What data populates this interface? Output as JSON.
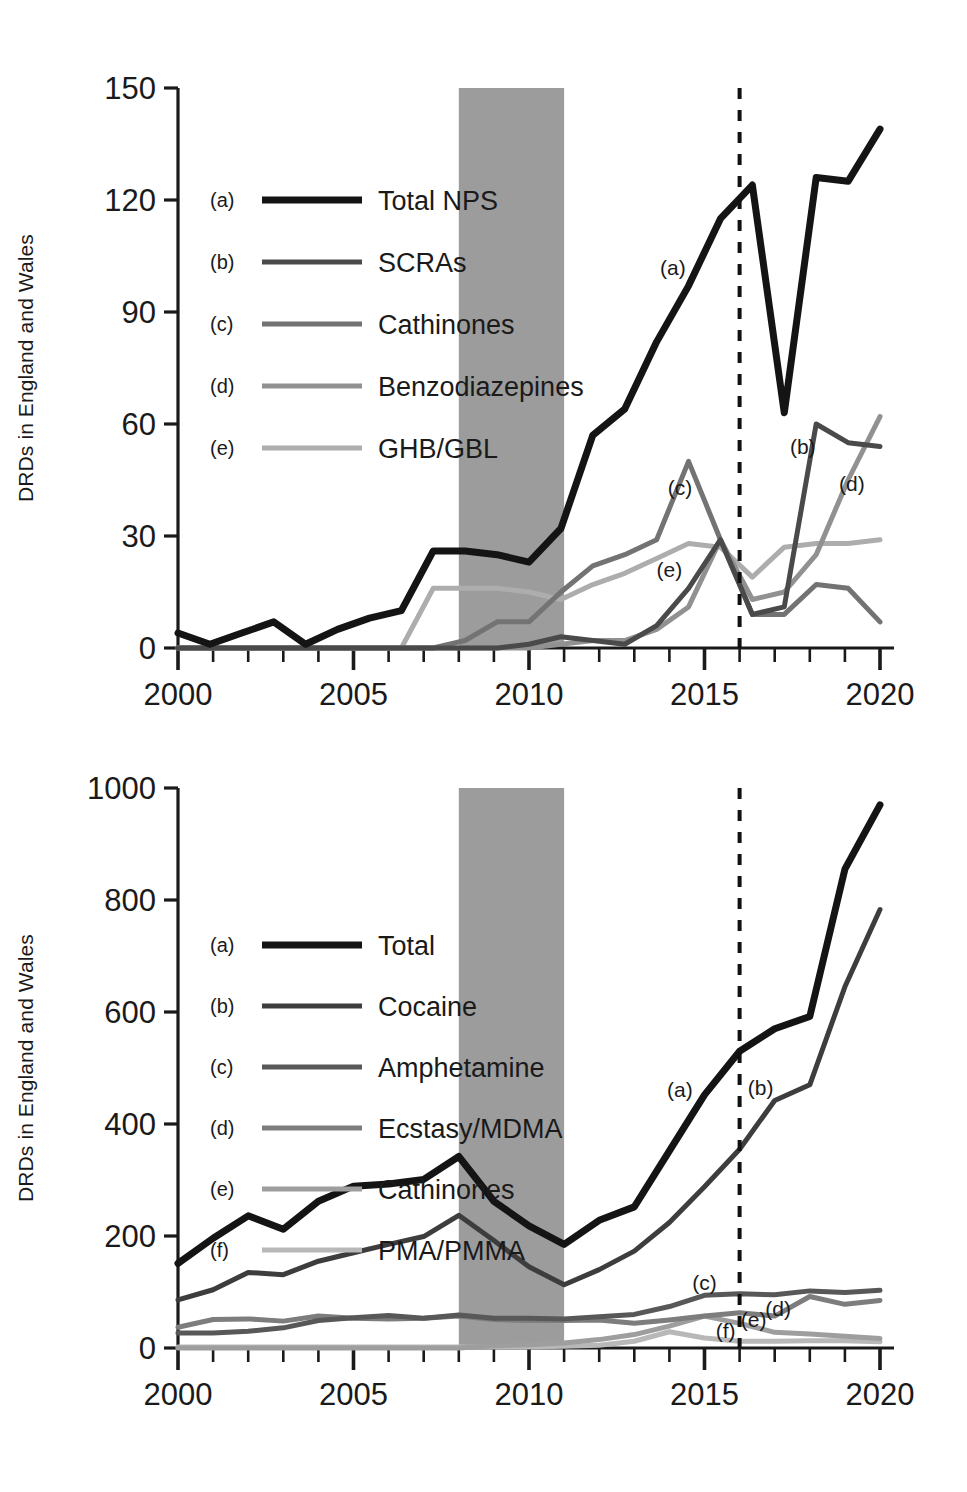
{
  "figure": {
    "panels": [
      {
        "id": "top",
        "ylabel": "DRDs in England and Wales",
        "axis": {
          "yticks": [
            0,
            30,
            60,
            90,
            120,
            150
          ],
          "ylim": [
            0,
            150
          ],
          "xticks": [
            2000,
            2005,
            2010,
            2015,
            2020
          ],
          "xtick_labels": [
            "2000",
            "2005",
            "2010",
            "2015",
            "2020"
          ],
          "xlim": [
            2000,
            2020
          ],
          "xminor_step": 1
        },
        "shaded_band": {
          "start": 2008,
          "end": 2011,
          "color": "#9c9c9c"
        },
        "dashed_line": {
          "x": 2016,
          "color": "#111111"
        },
        "legend": [
          {
            "key": "(a)",
            "label": "Total NPS",
            "color": "#141414",
            "width": 7
          },
          {
            "key": "(b)",
            "label": "SCRAs",
            "color": "#4a4a4a",
            "width": 5
          },
          {
            "key": "(c)",
            "label": "Cathinones",
            "color": "#737373",
            "width": 5
          },
          {
            "key": "(d)",
            "label": "Benzodiazepines",
            "color": "#919191",
            "width": 5
          },
          {
            "key": "(e)",
            "label": "GHB/GBL",
            "color": "#adadad",
            "width": 5
          }
        ],
        "annotations": [
          {
            "text": "(a)",
            "x": 2014.1,
            "y": 100
          },
          {
            "text": "(b)",
            "x": 2017.8,
            "y": 52
          },
          {
            "text": "(c)",
            "x": 2014.3,
            "y": 41
          },
          {
            "text": "(d)",
            "x": 2019.2,
            "y": 42
          },
          {
            "text": "(e)",
            "x": 2014.0,
            "y": 19
          }
        ]
      },
      {
        "id": "bottom",
        "ylabel": "DRDs in England and Wales",
        "axis": {
          "yticks": [
            0,
            200,
            400,
            600,
            800,
            1000
          ],
          "ylim": [
            0,
            1000
          ],
          "xticks": [
            2000,
            2005,
            2010,
            2015,
            2020
          ],
          "xtick_labels": [
            "2000",
            "2005",
            "2010",
            "2015",
            "2020"
          ],
          "xlim": [
            2000,
            2020
          ],
          "xminor_step": 1
        },
        "shaded_band": {
          "start": 2008,
          "end": 2011,
          "color": "#9c9c9c"
        },
        "dashed_line": {
          "x": 2016,
          "color": "#111111"
        },
        "legend": [
          {
            "key": "(a)",
            "label": "Total",
            "color": "#141414",
            "width": 7
          },
          {
            "key": "(b)",
            "label": "Cocaine",
            "color": "#3d3d3d",
            "width": 5
          },
          {
            "key": "(c)",
            "label": "Amphetamine",
            "color": "#585858",
            "width": 5
          },
          {
            "key": "(d)",
            "label": "Ecstasy/MDMA",
            "color": "#7d7d7d",
            "width": 5
          },
          {
            "key": "(e)",
            "label": "Cathinones",
            "color": "#9e9e9e",
            "width": 5
          },
          {
            "key": "(f)",
            "label": "PMA/PMMA",
            "color": "#b8b8b8",
            "width": 5
          }
        ],
        "annotations": [
          {
            "text": "(a)",
            "x": 2014.3,
            "y": 448
          },
          {
            "text": "(b)",
            "x": 2016.6,
            "y": 452
          },
          {
            "text": "(c)",
            "x": 2015.0,
            "y": 104
          },
          {
            "text": "(d)",
            "x": 2017.1,
            "y": 57
          },
          {
            "text": "(e)",
            "x": 2016.4,
            "y": 38
          },
          {
            "text": "(f)",
            "x": 2015.6,
            "y": 18
          }
        ]
      }
    ]
  },
  "chart_data": [
    {
      "type": "line",
      "panel": "top",
      "title": "",
      "xlabel": "",
      "ylabel": "DRDs in England and Wales",
      "x": [
        2000,
        2001,
        2002,
        2003,
        2004,
        2005,
        2006,
        2007,
        2008,
        2009,
        2010,
        2011,
        2012,
        2013,
        2014,
        2015,
        2016,
        2017,
        2018,
        2019,
        2020
      ],
      "xlim": [
        2000,
        2020
      ],
      "ylim": [
        0,
        150
      ],
      "yticks": [
        0,
        30,
        60,
        90,
        120,
        150
      ],
      "grid": false,
      "legend_position": "upper-left",
      "shaded_band": [
        2008,
        2011
      ],
      "reference_line_x": 2016,
      "series": [
        {
          "name": "Total NPS",
          "key": "(a)",
          "color": "#141414",
          "values": [
            4,
            1,
            4,
            7,
            1,
            5,
            8,
            10,
            26,
            26,
            25,
            23,
            32,
            57,
            64,
            82,
            97,
            115,
            124,
            63,
            126,
            125,
            139
          ]
        },
        {
          "name": "SCRAs",
          "key": "(b)",
          "color": "#4a4a4a",
          "values": [
            0,
            0,
            0,
            0,
            0,
            0,
            0,
            0,
            0,
            0,
            0,
            1,
            3,
            2,
            1,
            6,
            16,
            29,
            9,
            11,
            60,
            55,
            54
          ]
        },
        {
          "name": "Cathinones",
          "key": "(c)",
          "color": "#737373",
          "values": [
            0,
            0,
            0,
            0,
            0,
            0,
            0,
            0,
            0,
            2,
            7,
            7,
            15,
            22,
            25,
            29,
            50,
            29,
            9,
            9,
            17,
            16,
            7
          ]
        },
        {
          "name": "Benzodiazepines",
          "key": "(d)",
          "color": "#919191",
          "values": [
            0,
            0,
            0,
            0,
            0,
            0,
            0,
            0,
            0,
            0,
            0,
            0,
            1,
            2,
            2,
            5,
            11,
            29,
            13,
            15,
            25,
            45,
            62
          ]
        },
        {
          "name": "GHB/GBL",
          "key": "(e)",
          "color": "#adadad",
          "values": [
            0,
            0,
            0,
            0,
            0,
            0,
            0,
            0,
            16,
            16,
            16,
            15,
            13,
            17,
            20,
            24,
            28,
            27,
            19,
            27,
            28,
            28,
            29
          ]
        }
      ],
      "note": "Series arrays are aligned to the 21 year points 2000-2020; extra entries represent intermediate vertices drawn in the figure."
    },
    {
      "type": "line",
      "panel": "bottom",
      "title": "",
      "xlabel": "",
      "ylabel": "DRDs in England and Wales",
      "x": [
        2000,
        2001,
        2002,
        2003,
        2004,
        2005,
        2006,
        2007,
        2008,
        2009,
        2010,
        2011,
        2012,
        2013,
        2014,
        2015,
        2016,
        2017,
        2018,
        2019,
        2020
      ],
      "xlim": [
        2000,
        2020
      ],
      "ylim": [
        0,
        1000
      ],
      "yticks": [
        0,
        200,
        400,
        600,
        800,
        1000
      ],
      "grid": false,
      "legend_position": "upper-left",
      "shaded_band": [
        2008,
        2011
      ],
      "reference_line_x": 2016,
      "series": [
        {
          "name": "Total",
          "key": "(a)",
          "color": "#141414",
          "values": [
            151,
            196,
            236,
            212,
            262,
            289,
            293,
            301,
            342,
            262,
            218,
            185,
            228,
            252,
            352,
            452,
            530,
            570,
            592,
            855,
            970
          ]
        },
        {
          "name": "Cocaine",
          "key": "(b)",
          "color": "#3d3d3d",
          "values": [
            86,
            104,
            135,
            131,
            155,
            170,
            185,
            199,
            237,
            192,
            145,
            113,
            140,
            173,
            224,
            288,
            355,
            442,
            470,
            645,
            783
          ]
        },
        {
          "name": "Amphetamine",
          "key": "(c)",
          "color": "#585858",
          "values": [
            27,
            27,
            30,
            36,
            49,
            54,
            58,
            53,
            59,
            53,
            53,
            52,
            56,
            60,
            74,
            94,
            97,
            95,
            102,
            99,
            103
          ]
        },
        {
          "name": "Ecstasy/MDMA",
          "key": "(d)",
          "color": "#7d7d7d",
          "values": [
            37,
            51,
            52,
            48,
            57,
            53,
            52,
            53,
            57,
            51,
            49,
            49,
            50,
            44,
            50,
            57,
            63,
            57,
            92,
            78,
            85
          ]
        },
        {
          "name": "Cathinones",
          "key": "(e)",
          "color": "#9e9e9e",
          "values": [
            0,
            0,
            0,
            0,
            0,
            0,
            0,
            0,
            0,
            4,
            6,
            9,
            15,
            24,
            39,
            57,
            44,
            28,
            25,
            21,
            17
          ]
        },
        {
          "name": "PMA/PMMA",
          "key": "(f)",
          "color": "#b8b8b8",
          "values": [
            2,
            2,
            2,
            2,
            2,
            2,
            2,
            2,
            2,
            2,
            2,
            3,
            5,
            12,
            29,
            18,
            12,
            12,
            13,
            13,
            11
          ]
        }
      ]
    }
  ]
}
